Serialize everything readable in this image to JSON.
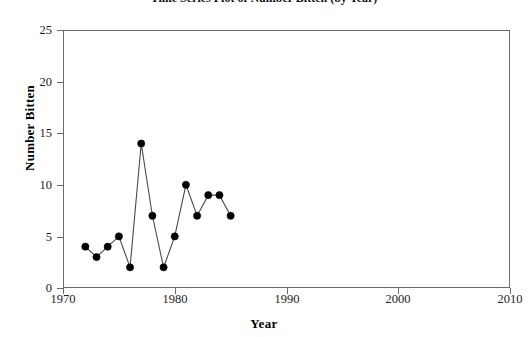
{
  "chart_data": {
    "type": "line",
    "title": "Time Series Plot of Number Bitten (by Year)",
    "xlabel": "Year",
    "ylabel": "Number Bitten",
    "xlim": [
      1970,
      2010
    ],
    "ylim": [
      0,
      25
    ],
    "xticks": [
      1970,
      1980,
      1990,
      2000,
      2010
    ],
    "yticks": [
      0,
      5,
      10,
      15,
      20,
      25
    ],
    "grid": false,
    "legend": null,
    "marker": "filled-circle",
    "line_color": "#4a4a4a",
    "marker_color": "#000000",
    "x": [
      1972,
      1973,
      1974,
      1975,
      1976,
      1977,
      1978,
      1979,
      1980,
      1981,
      1982,
      1983,
      1984,
      1985
    ],
    "values": [
      4,
      3,
      4,
      5,
      2,
      14,
      7,
      2,
      5,
      10,
      7,
      9,
      9,
      7
    ],
    "points": [
      {
        "year": 1972,
        "value": 4
      },
      {
        "year": 1973,
        "value": 3
      },
      {
        "year": 1974,
        "value": 4
      },
      {
        "year": 1975,
        "value": 5
      },
      {
        "year": 1976,
        "value": 2
      },
      {
        "year": 1977,
        "value": 14
      },
      {
        "year": 1978,
        "value": 7
      },
      {
        "year": 1979,
        "value": 2
      },
      {
        "year": 1980,
        "value": 5
      },
      {
        "year": 1981,
        "value": 10
      },
      {
        "year": 1982,
        "value": 7
      },
      {
        "year": 1983,
        "value": 9
      },
      {
        "year": 1984,
        "value": 9
      },
      {
        "year": 1985,
        "value": 7
      }
    ]
  },
  "axes": {
    "x_title": "Year",
    "y_title": "Number Bitten",
    "x_tick_labels": [
      "1970",
      "1980",
      "1990",
      "2000",
      "2010"
    ],
    "y_tick_labels": [
      "0",
      "5",
      "10",
      "15",
      "20",
      "25"
    ]
  },
  "title": {
    "text": "Time Series Plot of Number Bitten (by Year)"
  }
}
